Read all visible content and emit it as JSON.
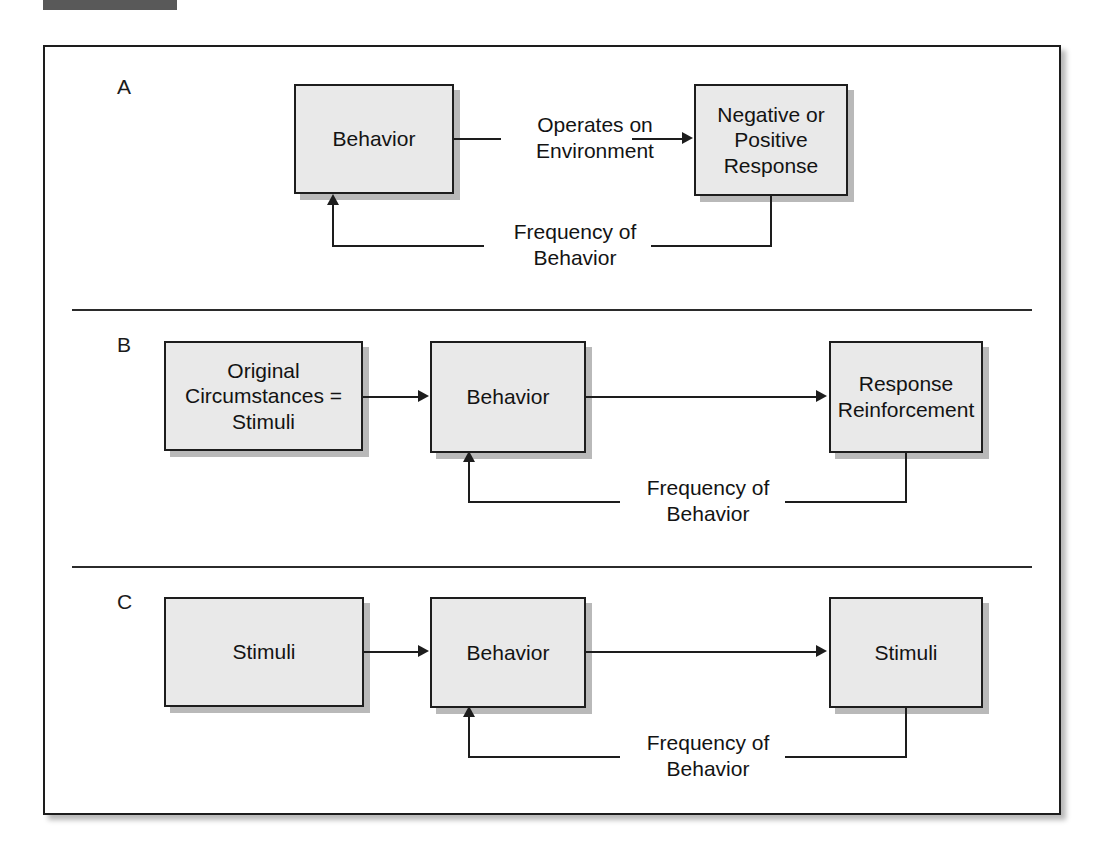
{
  "figure": {
    "panels": [
      {
        "id": "A",
        "label": "A",
        "nodes": [
          {
            "name": "behavior",
            "text": "Behavior"
          },
          {
            "name": "response",
            "text": "Negative or\nPositive\nResponse"
          }
        ],
        "edge_labels": [
          {
            "name": "operates-on-environment",
            "text": "Operates on\nEnvironment"
          },
          {
            "name": "frequency-of-behavior",
            "text": "Frequency of\nBehavior"
          }
        ]
      },
      {
        "id": "B",
        "label": "B",
        "nodes": [
          {
            "name": "original-circumstances",
            "text": "Original\nCircumstances =\nStimuli"
          },
          {
            "name": "behavior",
            "text": "Behavior"
          },
          {
            "name": "response-reinforcement",
            "text": "Response\nReinforcement"
          }
        ],
        "edge_labels": [
          {
            "name": "frequency-of-behavior",
            "text": "Frequency of\nBehavior"
          }
        ]
      },
      {
        "id": "C",
        "label": "C",
        "nodes": [
          {
            "name": "stimuli-left",
            "text": "Stimuli"
          },
          {
            "name": "behavior",
            "text": "Behavior"
          },
          {
            "name": "stimuli-right",
            "text": "Stimuli"
          }
        ],
        "edge_labels": [
          {
            "name": "frequency-of-behavior",
            "text": "Frequency of\nBehavior"
          }
        ]
      }
    ],
    "colors": {
      "node_fill": "#e9e9e9",
      "node_border": "#1d1d1d",
      "node_shadow": "#b9b9b9",
      "top_bar": "#595959"
    }
  }
}
